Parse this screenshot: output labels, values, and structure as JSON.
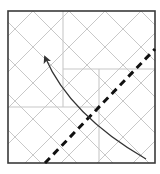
{
  "diagram": {
    "type": "origami-fold-step",
    "colors": {
      "background": "#ffffff",
      "border": "#3a3a3a",
      "crease": "#c8c8c8",
      "fold_line": "#111111",
      "arrow": "#333333"
    },
    "square": {
      "x": 8,
      "y": 11,
      "width": 147,
      "height": 152
    },
    "creases": {
      "orthogonal": [
        {
          "x1": 63,
          "y1": 11,
          "x2": 63,
          "y2": 107
        },
        {
          "x1": 63,
          "y1": 69,
          "x2": 155,
          "y2": 69
        },
        {
          "x1": 99,
          "y1": 69,
          "x2": 99,
          "y2": 163
        },
        {
          "x1": 8,
          "y1": 107,
          "x2": 99,
          "y2": 107
        }
      ],
      "diagonal_spacing": 36
    },
    "fold_line": {
      "x1": 45,
      "y1": 163,
      "x2": 155,
      "y2": 49,
      "style": "dashed"
    },
    "arrow": {
      "from": {
        "x": 146,
        "y": 159
      },
      "control": {
        "x": 70,
        "y": 115
      },
      "to": {
        "x": 45,
        "y": 57
      }
    }
  }
}
